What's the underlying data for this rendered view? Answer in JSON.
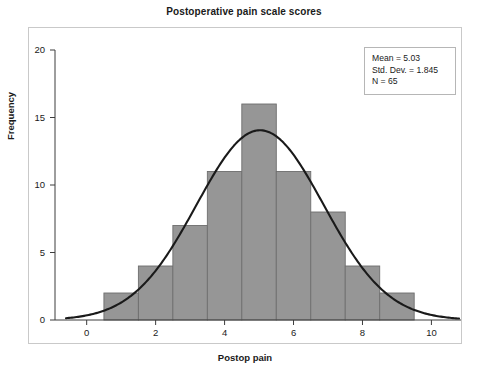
{
  "chart_data": {
    "type": "bar",
    "title": "Postoperative pain scale scores",
    "xlabel": "Postop pain",
    "ylabel": "Frequency",
    "categories": [
      1,
      2,
      3,
      4,
      5,
      6,
      7,
      8,
      9
    ],
    "values": [
      2,
      4,
      7,
      11,
      16,
      11,
      8,
      4,
      2
    ],
    "bin_edges": [
      0.5,
      1.5,
      2.5,
      3.5,
      4.5,
      5.5,
      6.5,
      7.5,
      8.5,
      9.5
    ],
    "xlim": [
      -0.6,
      10.8
    ],
    "ylim": [
      0,
      20
    ],
    "xticks": [
      0,
      2,
      4,
      6,
      8,
      10
    ],
    "yticks": [
      0,
      5,
      10,
      15,
      20
    ],
    "grid": false,
    "legend_position": "top-right",
    "overlay": {
      "type": "line",
      "name": "normal-curve",
      "mean": 5.03,
      "std_dev": 1.845,
      "n": 65,
      "bin_width": 1,
      "peak_value": 14.05
    },
    "annotations": [
      "Mean = 5.03",
      "Std. Dev. = 1.845",
      "N = 65"
    ],
    "colors": {
      "bar_fill": "#969696",
      "bar_stroke": "#6e6e6e",
      "curve": "#1a1a1a",
      "axis": "#3c3c3c",
      "frame": "#c9c9c9",
      "background": "#ffffff",
      "text": "#1a1a1a"
    }
  },
  "stats_box": {
    "mean_label": "Mean = 5.03",
    "std_dev_label": "Std. Dev. = 1.845",
    "n_label": "N = 65"
  },
  "axes": {
    "y_tick_labels": [
      "0",
      "5",
      "10",
      "15",
      "20"
    ],
    "x_tick_labels": [
      "0",
      "2",
      "4",
      "6",
      "8",
      "10"
    ],
    "y_title": "Frequency",
    "x_title": "Postop pain"
  },
  "caption": {
    "text": ""
  }
}
